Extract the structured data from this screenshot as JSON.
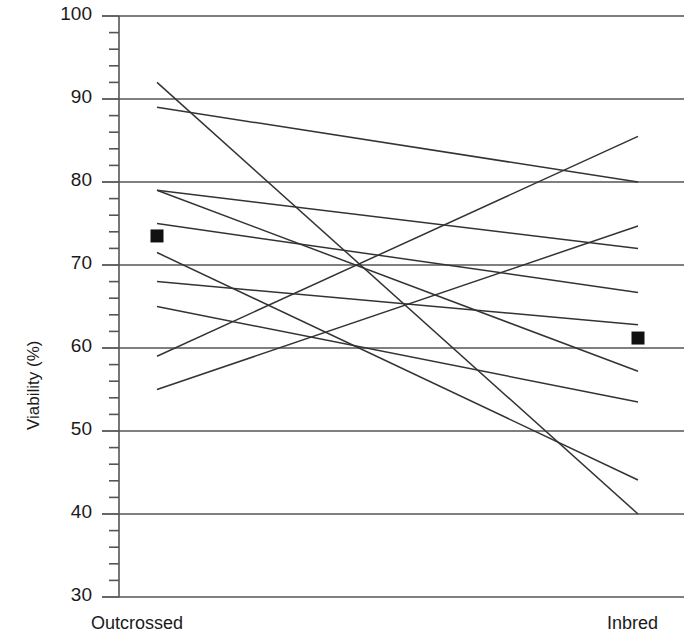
{
  "chart_data": {
    "type": "line",
    "title": "",
    "subtitle": "",
    "xlabel": "",
    "ylabel": "Viability (%)",
    "categories": [
      "Outcrossed",
      "Inbred"
    ],
    "tick_labels_y": [
      "100",
      "90",
      "80",
      "70",
      "60",
      "50",
      "40",
      "30"
    ],
    "ylim": [
      30,
      100
    ],
    "ytick_step": 10,
    "yminor_step": 2,
    "grid": "horizontal-major",
    "legend": "none",
    "annotations": [],
    "series": [
      {
        "name": "family-1",
        "values": [
          92.0,
          40.0
        ]
      },
      {
        "name": "family-2",
        "values": [
          89.0,
          80.0
        ]
      },
      {
        "name": "family-3",
        "values": [
          79.0,
          57.2
        ]
      },
      {
        "name": "family-4",
        "values": [
          79.0,
          72.0
        ]
      },
      {
        "name": "family-5",
        "values": [
          75.0,
          66.7
        ]
      },
      {
        "name": "family-6",
        "values": [
          71.5,
          44.1
        ]
      },
      {
        "name": "family-7",
        "values": [
          68.0,
          62.8
        ]
      },
      {
        "name": "family-8",
        "values": [
          65.0,
          53.5
        ]
      },
      {
        "name": "family-9",
        "values": [
          59.0,
          85.5
        ]
      },
      {
        "name": "family-10",
        "values": [
          55.0,
          74.7
        ]
      }
    ],
    "means": {
      "marker": "filled-square",
      "color": "#111111",
      "values": [
        73.5,
        61.2
      ]
    },
    "line_color": "#333333",
    "axis_color": "#555555",
    "grid_color": "#555555"
  }
}
